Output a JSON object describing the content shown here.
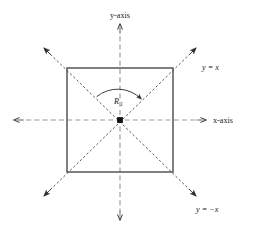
{
  "figure": {
    "title": "",
    "labels": {
      "y_axis": "y-axis",
      "x_axis": "x-axis",
      "line_y_equals_x": "y = x",
      "line_y_equals_neg_x": "y = −x",
      "rotation_symbol": "R",
      "rotation_subscript": "1"
    },
    "colors": {
      "stroke": "#1a1a1a",
      "square_stroke": "#55565a",
      "axis_stroke": "#9a9a9e",
      "background": "#ffffff"
    },
    "geometry": {
      "center": {
        "x": 120,
        "y": 120
      },
      "square": {
        "left": 67,
        "top": 68,
        "right": 173,
        "bottom": 172
      },
      "x_axis": {
        "x_start": 12,
        "x_end": 208,
        "y": 120
      },
      "y_axis": {
        "y_start": 22,
        "y_end": 222,
        "x": 120
      },
      "diagonal_y_equals_x": {
        "x1": 43,
        "y1": 197,
        "x2": 197,
        "y2": 47
      },
      "diagonal_y_equals_neg_x": {
        "x1": 43,
        "y1": 47,
        "x2": 197,
        "y2": 197
      },
      "arc": {
        "radius": 33,
        "start_angle_deg": 135,
        "end_angle_deg": 45
      }
    }
  }
}
